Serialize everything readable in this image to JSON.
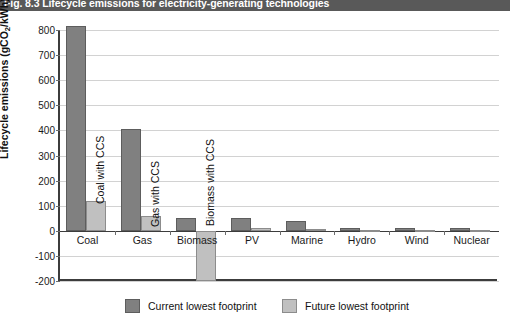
{
  "figure": {
    "title": "Fig. 8.3 Lifecycle emissions for electricity-generating technologies",
    "title_bar_color": "#595959"
  },
  "chart_data": {
    "type": "bar",
    "title": "Fig. 8.3 Lifecycle emissions for electricity-generating technologies",
    "xlabel": "",
    "ylabel": "Lifecycle emissions (gCO2/kWh)",
    "ylabel_parts": {
      "pre": "Lifecycle emissions (gCO",
      "sub": "2",
      "post": "/kWh)"
    },
    "categories": [
      "Coal",
      "Gas",
      "Biomass",
      "PV",
      "Marine",
      "Hydro",
      "Wind",
      "Nuclear"
    ],
    "series": [
      {
        "name": "Current lowest footprint",
        "color": "#808080",
        "values": [
          815,
          405,
          50,
          50,
          40,
          12,
          12,
          12
        ]
      },
      {
        "name": "Future lowest footprint",
        "color": "#c0c0c0",
        "values": [
          120,
          60,
          -200,
          10,
          8,
          5,
          5,
          5
        ]
      }
    ],
    "ylim": [
      -200,
      800
    ],
    "yticks": [
      800,
      700,
      600,
      500,
      400,
      300,
      200,
      100,
      0,
      -100,
      -200
    ],
    "ytick_labels": [
      "800",
      "700",
      "600",
      "500",
      "400",
      "300",
      "200",
      "100",
      "0",
      "-100",
      "-200"
    ],
    "grid": true,
    "legend_position": "bottom",
    "annotations": [
      {
        "text": "Coal with CCS",
        "category": "Coal",
        "series": "Future lowest footprint"
      },
      {
        "text": "Gas with CCS",
        "category": "Gas",
        "series": "Future lowest footprint"
      },
      {
        "text": "Biomass with CCS",
        "category": "Biomass",
        "series": "Future lowest footprint"
      }
    ]
  },
  "legend": {
    "items": [
      {
        "label": "Current lowest footprint",
        "color": "#808080"
      },
      {
        "label": "Future lowest footprint",
        "color": "#c0c0c0"
      }
    ]
  }
}
